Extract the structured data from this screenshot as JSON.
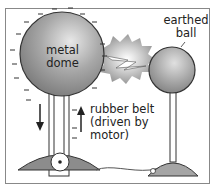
{
  "diagram": {
    "type": "Van de Graaff generator",
    "labels": {
      "dome_line1": "metal",
      "dome_line2": "dome",
      "ball_line1": "earthed",
      "ball_line2": "ball",
      "belt_line1": "rubber belt",
      "belt_line2": "(driven by",
      "belt_line3": "motor)"
    },
    "charge_symbol": "–",
    "colors": {
      "dome": "#9a9a9a",
      "ball": "#a0a0a0",
      "spark": "#bdbdbd",
      "base": "#8c8c8c",
      "outline": "#333333"
    }
  }
}
